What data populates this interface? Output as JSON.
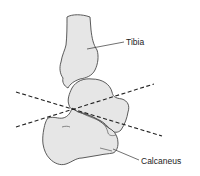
{
  "diagram": {
    "labels": {
      "tibia": "Tibia",
      "calcaneus": "Calcaneus"
    },
    "structures": [
      "tibia",
      "talus",
      "calcaneus"
    ],
    "cut_lines": 2,
    "colors": {
      "bone_fill": "#e6e6e6",
      "bone_outline": "#4a4a4a",
      "cut_line": "#222222",
      "text": "#222222"
    }
  }
}
